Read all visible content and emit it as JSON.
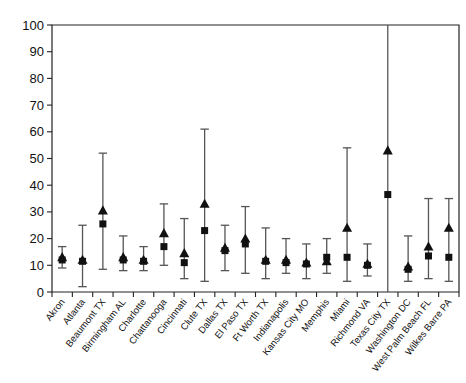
{
  "chart_data": {
    "type": "scatter",
    "title": "",
    "xlabel": "",
    "ylabel": "",
    "ylim": [
      0,
      100
    ],
    "ytick_values": [
      0,
      10,
      20,
      30,
      40,
      50,
      60,
      70,
      80,
      90,
      100
    ],
    "ytick_labels": [
      "0",
      "10",
      "20",
      "30",
      "40",
      "50",
      "60",
      "70",
      "80",
      "90",
      "100"
    ],
    "grid": false,
    "legend": "none",
    "categories": [
      "Akron",
      "Atlanta",
      "Beaumont TX",
      "Birmingham AL",
      "Charlotte",
      "Chattanooga",
      "Cincinnati",
      "Clute TX",
      "Dallas TX",
      "El Paso TX",
      "Ft Worth TX",
      "Indianapolis",
      "Kansas City MO",
      "Memphis",
      "Miami",
      "Richmond VA",
      "Texas City TX",
      "Washington DC",
      "West Palm Beach FL",
      "Wilkes Barre PA"
    ],
    "series": [
      {
        "name": "triangle",
        "marker": "triangle",
        "values": [
          13,
          12,
          30.5,
          13,
          12,
          22,
          14.5,
          33,
          16.5,
          20,
          12,
          12,
          11,
          11.5,
          24,
          10.5,
          53,
          9.5,
          17,
          24
        ]
      },
      {
        "name": "square",
        "marker": "square",
        "values": [
          12,
          11.5,
          25.5,
          12,
          11.5,
          17,
          11,
          23,
          15.5,
          18,
          11.5,
          11,
          10.5,
          13,
          13,
          10,
          36.5,
          8.5,
          13.5,
          13
        ]
      }
    ],
    "error_bars": {
      "lower": [
        9,
        2,
        8.5,
        8,
        8,
        10,
        5,
        4,
        8,
        7,
        5,
        7,
        5,
        7,
        4,
        6,
        0,
        4,
        5,
        4
      ],
      "upper": [
        17,
        25,
        52,
        21,
        17,
        33,
        27.5,
        61,
        25,
        32,
        24,
        20,
        18,
        20,
        54,
        18,
        100,
        21,
        35,
        35
      ]
    }
  }
}
